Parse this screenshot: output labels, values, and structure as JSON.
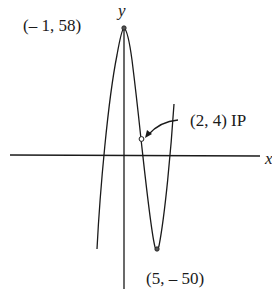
{
  "figure": {
    "type": "function-graph",
    "axes": {
      "x_label": "x",
      "y_label": "y"
    },
    "points": [
      {
        "id": "local-max",
        "label": "(– 1, 58)",
        "x": -1,
        "y": 58
      },
      {
        "id": "inflection",
        "label": "(2, 4) IP",
        "x": 2,
        "y": 4
      },
      {
        "id": "local-min",
        "label": "(5, – 50)",
        "x": 5,
        "y": -50
      }
    ],
    "colors": {
      "ink": "#1a1a1a",
      "background": "#ffffff"
    }
  }
}
